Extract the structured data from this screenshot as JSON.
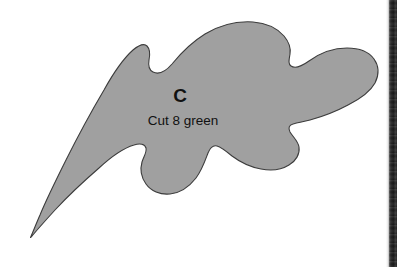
{
  "document": {
    "type": "sewing-pattern-template-piece",
    "background_color": "#ffffff"
  },
  "pattern_piece": {
    "letter": "C",
    "instruction": "Cut 8 green",
    "fill_color": "#a0a0a0",
    "outline_color": "#3c3c3c",
    "text_color": "#111111",
    "shape_name": "leaf-applique-piece-c"
  },
  "scan_artifact": {
    "edge_strip_color": "#1f1f1f",
    "label": "page-edge-shadow"
  }
}
